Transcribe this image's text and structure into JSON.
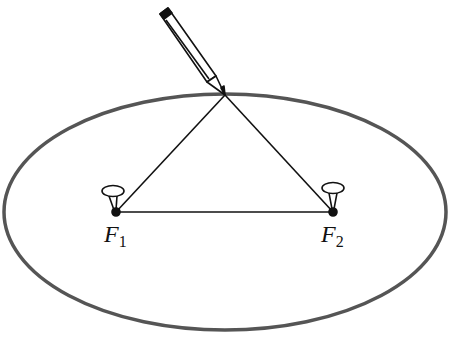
{
  "diagram": {
    "colors": {
      "ellipse": "#555555",
      "lines": "#111111",
      "background": "#ffffff"
    },
    "ellipse": {
      "cx": 225,
      "cy": 212,
      "rx": 221,
      "ry": 118
    },
    "pencil_tip": {
      "x": 225,
      "y": 95
    },
    "foci": [
      {
        "id": "F1",
        "name": "F",
        "subscript": "1",
        "x": 116,
        "y": 212
      },
      {
        "id": "F2",
        "name": "F",
        "subscript": "2",
        "x": 333,
        "y": 212
      }
    ],
    "elements": [
      "ellipse",
      "pencil",
      "string triangle",
      "pin at F1",
      "pin at F2"
    ]
  }
}
